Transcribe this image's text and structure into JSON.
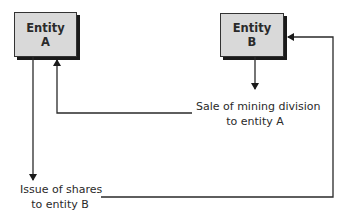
{
  "entities": [
    {
      "id": "A",
      "line1": "Entity",
      "line2": "A"
    },
    {
      "id": "B",
      "line1": "Entity",
      "line2": "B"
    }
  ],
  "flows": [
    {
      "from": "B",
      "to": "A",
      "line1": "Sale of mining division",
      "line2": "to entity A"
    },
    {
      "from": "A",
      "to": "B",
      "line1": "Issue of shares",
      "line2": "to entity B"
    }
  ],
  "colors": {
    "box_fill": "#d9d9d9",
    "box_shadow": "#1a1a1a",
    "line": "#2a2a2a"
  }
}
